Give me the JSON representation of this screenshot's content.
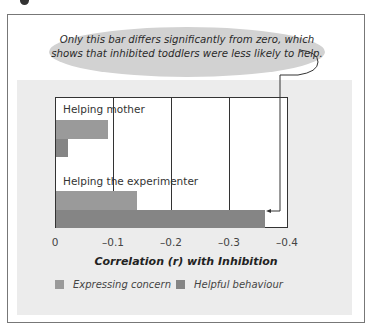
{
  "callout": {
    "line1": "Only this bar differs significantly from zero, which",
    "line2": "shows that inhibited toddlers were less likely to help."
  },
  "colors": {
    "expressing_concern": "#9a9a9a",
    "helpful_behaviour": "#858585",
    "panel_bg": "#ececec",
    "bubble_bg": "#d2d2d2"
  },
  "chart_data": {
    "type": "bar",
    "orientation": "horizontal",
    "title": "",
    "categories": [
      "Helping mother",
      "Helping the experimenter"
    ],
    "series": [
      {
        "name": "Expressing concern",
        "values": [
          -0.09,
          -0.14
        ]
      },
      {
        "name": "Helpful behaviour",
        "values": [
          -0.02,
          -0.36
        ]
      }
    ],
    "xlabel": "Correlation (r) with Inhibition",
    "ylabel": "",
    "xlim": [
      0,
      -0.4
    ],
    "xticks": [
      "0",
      "–0.1",
      "–0.2",
      "–0.3",
      "–0.4"
    ],
    "grid": true,
    "legend_position": "bottom",
    "annotation": "Only this bar differs significantly from zero, which shows that inhibited toddlers were less likely to help."
  },
  "legend": {
    "items": [
      {
        "label": "Expressing concern"
      },
      {
        "label": "Helpful behaviour"
      }
    ]
  }
}
